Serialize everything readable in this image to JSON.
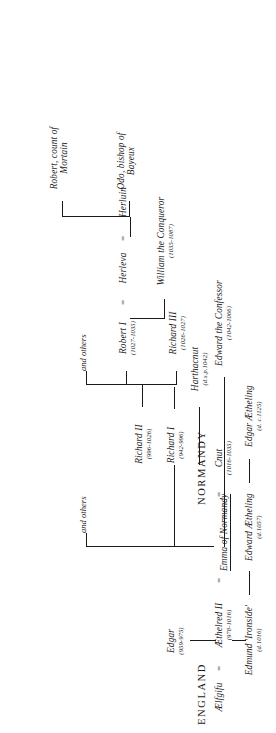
{
  "diagram": {
    "type": "genealogy-tree",
    "orientation": "rotated-90-ccw",
    "headings": {
      "england": "ENGLAND",
      "normandy": "NORMANDY"
    },
    "marriage_symbol": "=",
    "branch_label_1": "and others",
    "branch_label_2": "and others",
    "people": [
      {
        "id": "edgar",
        "name": "Edgar",
        "dates": "(959-975)"
      },
      {
        "id": "aelfgifu",
        "name": "Ælfgifu",
        "dates": ""
      },
      {
        "id": "aethelred2",
        "name": "Æthelred II",
        "dates": "(978-1016)"
      },
      {
        "id": "emma",
        "name": "Emma of Normandy",
        "dates": "",
        "underlined": true
      },
      {
        "id": "cnut",
        "name": "Cnut",
        "dates": "(1016-1035)"
      },
      {
        "id": "edmund",
        "name": "Edmund 'Ironside'",
        "dates": "(d.1016)"
      },
      {
        "id": "edwardaeth",
        "name": "Edward Ætheling",
        "dates": "(d.1057)"
      },
      {
        "id": "edgaraeth",
        "name": "Edgar Ætheling",
        "dates": "(d. c.1125)"
      },
      {
        "id": "edwardconf",
        "name": "Edward the Confessor",
        "dates": "(1042-1066)"
      },
      {
        "id": "harthacnut",
        "name": "Harthacnut",
        "dates": "(d.s.p.1042)"
      },
      {
        "id": "richard1",
        "name": "Richard I",
        "dates": "(942-996)"
      },
      {
        "id": "richard2",
        "name": "Richard II",
        "dates": "(996-1026)"
      },
      {
        "id": "richard3",
        "name": "Richard III",
        "dates": "(1026-1027)"
      },
      {
        "id": "robert1",
        "name": "Robert I",
        "dates": "(1027-1035)"
      },
      {
        "id": "herleva",
        "name": "Herleva",
        "dates": ""
      },
      {
        "id": "herluin",
        "name": "Herluin",
        "dates": ""
      },
      {
        "id": "william",
        "name": "William the Conqueror",
        "dates": "(1035-1087)"
      },
      {
        "id": "odo",
        "name": "Odo, bishop of",
        "dates": "",
        "line2": "Bayeux"
      },
      {
        "id": "mortain",
        "name": "Robert, count of",
        "dates": "",
        "line2": "Mortain"
      }
    ],
    "colors": {
      "ink": "#1a1a1a",
      "paper": "#ffffff"
    }
  }
}
